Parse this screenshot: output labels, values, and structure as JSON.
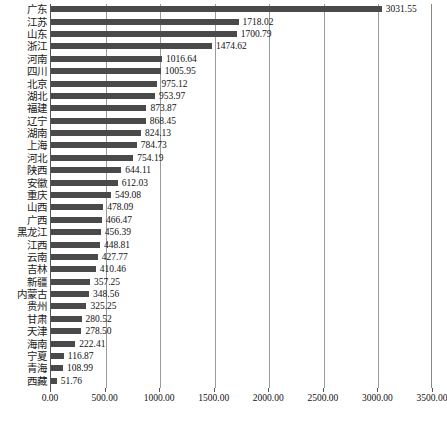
{
  "chart_data": {
    "type": "bar",
    "orientation": "horizontal",
    "title": "",
    "xlabel": "",
    "ylabel": "",
    "xlim": [
      0,
      3500
    ],
    "grid": true,
    "legend": null,
    "bar_color": "#4a4a4a",
    "axis_color": "#555555",
    "gridline_color": "#9a9a9a",
    "tick_labels": [
      "0.00",
      "500.00",
      "1000.00",
      "1500.00",
      "2000.00",
      "2500.00",
      "3000.00",
      "3500.00"
    ],
    "tick_values": [
      0,
      500,
      1000,
      1500,
      2000,
      2500,
      3000,
      3500
    ],
    "categories": [
      "广东",
      "江苏",
      "山东",
      "浙江",
      "河南",
      "四川",
      "北京",
      "湖北",
      "福建",
      "辽宁",
      "湖南",
      "上海",
      "河北",
      "陕西",
      "安徽",
      "重庆",
      "山西",
      "广西",
      "黑龙江",
      "江西",
      "云南",
      "吉林",
      "新疆",
      "内蒙古",
      "贵州",
      "甘肃",
      "天津",
      "海南",
      "宁夏",
      "青海",
      "西藏"
    ],
    "values": [
      3031.55,
      1718.02,
      1700.79,
      1474.62,
      1016.64,
      1005.95,
      975.12,
      953.97,
      873.87,
      868.45,
      824.13,
      784.73,
      754.19,
      644.11,
      612.03,
      549.08,
      478.09,
      466.47,
      456.39,
      448.81,
      427.77,
      410.46,
      357.25,
      348.56,
      325.25,
      280.52,
      278.5,
      222.41,
      116.87,
      108.99,
      51.76
    ],
    "value_labels": [
      "3031.55",
      "1718.02",
      "1700.79",
      "1474.62",
      "1016.64",
      "1005.95",
      "975.12",
      "953.97",
      "873.87",
      "868.45",
      "824.13",
      "784.73",
      "754.19",
      "644.11",
      "612.03",
      "549.08",
      "478.09",
      "466.47",
      "456.39",
      "448.81",
      "427.77",
      "410.46",
      "357.25",
      "348.56",
      "325.25",
      "280.52",
      "278.50",
      "222.41",
      "116.87",
      "108.99",
      "51.76"
    ]
  },
  "caption": ""
}
